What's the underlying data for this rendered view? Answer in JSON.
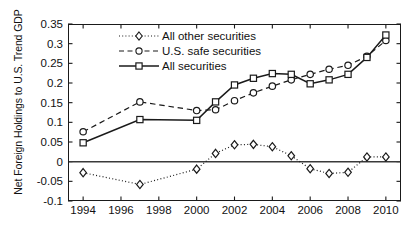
{
  "chart_data": {
    "type": "line",
    "title": "",
    "xlabel": "",
    "ylabel": "Net Foreign Holdings to U.S. Trend GDP",
    "xlim": [
      1993.2,
      2010.8
    ],
    "ylim": [
      -0.1,
      0.35
    ],
    "grid": false,
    "legend_position": "top-left-inside",
    "xticks": [
      "1994",
      "1996",
      "1998",
      "2000",
      "2002",
      "2004",
      "2006",
      "2008",
      "2010"
    ],
    "xtick_values": [
      1994,
      1996,
      1998,
      2000,
      2002,
      2004,
      2006,
      2008,
      2010
    ],
    "yticks": [
      "0.35",
      "0.3",
      "0.25",
      "0.2",
      "0.15",
      "0.1",
      "0.05",
      "0",
      "-0.05",
      "-0.1"
    ],
    "ytick_values": [
      0.35,
      0.3,
      0.25,
      0.2,
      0.15,
      0.1,
      0.05,
      0,
      -0.05,
      -0.1
    ],
    "zero_line": 0,
    "series": [
      {
        "name": "All other securities",
        "marker": "diamond",
        "line_style": "dotted",
        "color": "#1a1a1a",
        "x": [
          1994,
          1997,
          2000,
          2001,
          2002,
          2003,
          2004,
          2005,
          2006,
          2007,
          2008,
          2009,
          2010
        ],
        "values": [
          -0.028,
          -0.058,
          -0.019,
          0.021,
          0.043,
          0.044,
          0.038,
          0.015,
          -0.018,
          -0.03,
          -0.027,
          0.012,
          0.012
        ]
      },
      {
        "name": "U.S. safe securities",
        "marker": "circle",
        "line_style": "dashed",
        "color": "#1a1a1a",
        "x": [
          1994,
          1997,
          2000,
          2001,
          2002,
          2003,
          2004,
          2005,
          2006,
          2007,
          2008,
          2009,
          2010
        ],
        "values": [
          0.076,
          0.152,
          0.13,
          0.132,
          0.155,
          0.175,
          0.192,
          0.208,
          0.222,
          0.235,
          0.245,
          0.268,
          0.308
        ]
      },
      {
        "name": "All securities",
        "marker": "square",
        "line_style": "solid",
        "color": "#1a1a1a",
        "x": [
          1994,
          1997,
          2000,
          2001,
          2002,
          2003,
          2004,
          2005,
          2006,
          2007,
          2008,
          2009,
          2010
        ],
        "values": [
          0.048,
          0.107,
          0.105,
          0.152,
          0.195,
          0.212,
          0.224,
          0.222,
          0.198,
          0.208,
          0.222,
          0.265,
          0.322
        ]
      }
    ]
  },
  "legend": {
    "items": [
      {
        "label": "All other securities"
      },
      {
        "label": "U.S. safe securities"
      },
      {
        "label": "All securities"
      }
    ]
  }
}
